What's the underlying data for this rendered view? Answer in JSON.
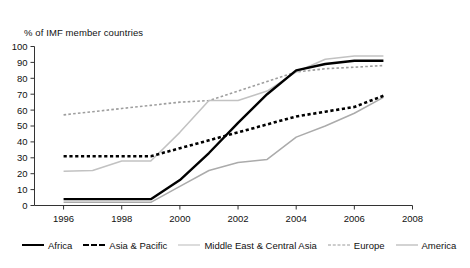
{
  "chart_data": {
    "type": "line",
    "title": "",
    "ylabel": "% of IMF member countries",
    "xlabel": "",
    "ylim": [
      0,
      100
    ],
    "xlim": [
      1995,
      2008
    ],
    "ytick_labels": [
      "0",
      "10",
      "20",
      "30",
      "40",
      "50",
      "60",
      "70",
      "80",
      "90",
      "100"
    ],
    "yticks": [
      0,
      10,
      20,
      30,
      40,
      50,
      60,
      70,
      80,
      90,
      100
    ],
    "xtick_labels": [
      "1996",
      "1998",
      "2000",
      "2002",
      "2004",
      "2006",
      "2008"
    ],
    "xticks": [
      1996,
      1998,
      2000,
      2002,
      2004,
      2006,
      2008
    ],
    "grid": false,
    "legend_position": "bottom",
    "x": [
      1996,
      1997,
      1998,
      1999,
      2000,
      2001,
      2002,
      2003,
      2004,
      2005,
      2006,
      2007
    ],
    "series": [
      {
        "name": "Africa",
        "style": "solid-thick-black",
        "color": "#000000",
        "values": [
          4,
          4,
          4,
          4,
          16,
          33,
          52,
          70,
          85,
          89,
          91,
          91
        ]
      },
      {
        "name": "Asia & Pacific",
        "style": "dashed-thick-black",
        "color": "#000000",
        "values": [
          31,
          31,
          31,
          31,
          36,
          41,
          46,
          51,
          56,
          59,
          62,
          69
        ]
      },
      {
        "name": "Middle East & Central Asia",
        "style": "solid-light-gray",
        "color": "#bdbdbd",
        "values": [
          21.5,
          22,
          28,
          28,
          46,
          66,
          66,
          72,
          84,
          92,
          94,
          94
        ]
      },
      {
        "name": "Europe",
        "style": "dashed-gray",
        "color": "#9a9a9a",
        "values": [
          57,
          59,
          61,
          63,
          65,
          66,
          72,
          78,
          84,
          86,
          87,
          88
        ]
      },
      {
        "name": "America",
        "style": "solid-medium-gray",
        "color": "#a8a8a8",
        "values": [
          2,
          2,
          2,
          2,
          12,
          22,
          27,
          29,
          43,
          50,
          58,
          68
        ]
      }
    ]
  },
  "legend": {
    "items": [
      {
        "label": "Africa",
        "key": "africa"
      },
      {
        "label": "Asia & Pacific",
        "key": "asia"
      },
      {
        "label": "Middle East & Central Asia",
        "key": "mideast"
      },
      {
        "label": "Europe",
        "key": "europe"
      },
      {
        "label": "America",
        "key": "america"
      }
    ]
  }
}
